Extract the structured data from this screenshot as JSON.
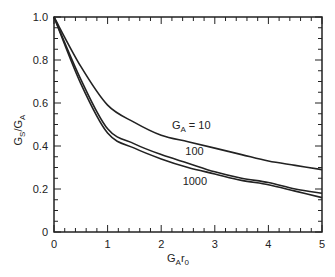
{
  "chart_data": {
    "type": "line",
    "title": "",
    "xlabel": "GAr0",
    "xlabel_parts": {
      "main": "G",
      "sub": "A",
      "main2": "r",
      "sub2": "0"
    },
    "ylabel": "GS/GA",
    "ylabel_parts": {
      "main": "G",
      "sub": "S",
      "sep": "/",
      "main2": "G",
      "sub2": "A"
    },
    "xlim": [
      0,
      5
    ],
    "ylim": [
      0,
      1.0
    ],
    "xticks": [
      0,
      1,
      2,
      3,
      4,
      5
    ],
    "xtick_labels": [
      "0",
      "1",
      "2",
      "3",
      "4",
      "5"
    ],
    "yticks": [
      0,
      0.2,
      0.4,
      0.6,
      0.8,
      1.0
    ],
    "ytick_labels": [
      "0",
      "0.2",
      "0.4",
      "0.6",
      "0.8",
      "1.0"
    ],
    "grid": false,
    "legend": "inline labels",
    "x": [
      0,
      0.5,
      1,
      1.5,
      2,
      2.5,
      3,
      3.5,
      4,
      4.5,
      5
    ],
    "series": [
      {
        "name": "GA = 10",
        "values": [
          1.0,
          0.77,
          0.59,
          0.51,
          0.45,
          0.42,
          0.39,
          0.36,
          0.33,
          0.31,
          0.29
        ]
      },
      {
        "name": "100",
        "values": [
          1.0,
          0.71,
          0.48,
          0.41,
          0.36,
          0.32,
          0.28,
          0.25,
          0.23,
          0.2,
          0.18
        ]
      },
      {
        "name": "1000",
        "values": [
          1.0,
          0.69,
          0.46,
          0.39,
          0.34,
          0.3,
          0.27,
          0.24,
          0.22,
          0.19,
          0.16
        ]
      }
    ],
    "annotations": [
      {
        "text": "GA = 10",
        "x": 2.2,
        "y": 0.48
      },
      {
        "text": "100",
        "x": 2.45,
        "y": 0.36
      },
      {
        "text": "1000",
        "x": 2.4,
        "y": 0.22
      }
    ]
  },
  "colors": {
    "line": "#222222",
    "background": "#ffffff"
  }
}
